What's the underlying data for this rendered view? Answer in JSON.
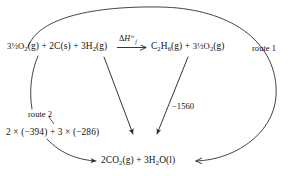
{
  "diagram": {
    "type": "energy-cycle",
    "reactants": {
      "oxygen_excess": "3½O",
      "oxygen_excess_sub": "2",
      "oxygen_excess_state": "(g)",
      "carbon": "2C",
      "carbon_state": "(s)",
      "hydrogen": "3H",
      "hydrogen_sub": "2",
      "hydrogen_state": "(g)",
      "plus_1": "+",
      "plus_2": "+"
    },
    "products_top": {
      "ethane": "C",
      "ethane_sub_1": "2",
      "ethane_h": "H",
      "ethane_sub_2": "6",
      "ethane_state": "(g)",
      "oxygen": "3½O",
      "oxygen_sub": "2",
      "oxygen_state": "(g)",
      "plus": "+"
    },
    "products_bottom": {
      "carbon_dioxide": "2CO",
      "carbon_dioxide_sub": "2",
      "carbon_dioxide_state": "(g)",
      "water": "3H",
      "water_sub": "2",
      "water_o": "O",
      "water_state": "(l)",
      "plus": "+"
    },
    "enthalpy_label": {
      "delta": "Δ",
      "symbol": "H",
      "subscript": "f",
      "superscript": "⦵"
    },
    "labels": {
      "route_1": "route 1",
      "route_2": "route 2",
      "combustion_value": "−1560",
      "formation_sum": {
        "co2_coeff": "2",
        "times_1": "×",
        "co2_value": "(−394)",
        "plus": "+",
        "h2o_coeff": "3",
        "times_2": "×",
        "h2o_value": "(−286)"
      }
    },
    "colors": {
      "ink": "#111111",
      "line": "#3a3a3a",
      "background": "#ffffff"
    }
  }
}
